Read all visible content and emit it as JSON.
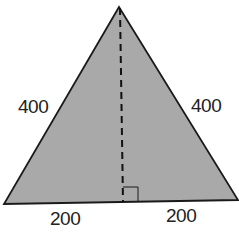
{
  "diagram": {
    "shape": "isosceles triangle",
    "fill_color": "#a9a9a9",
    "stroke_color": "#1a1a1a",
    "altitude": "dashed line from apex to base midpoint",
    "right_angle_marker": true,
    "labels": {
      "left_side": "400",
      "right_side": "400",
      "base_left": "200",
      "base_right": "200"
    }
  }
}
